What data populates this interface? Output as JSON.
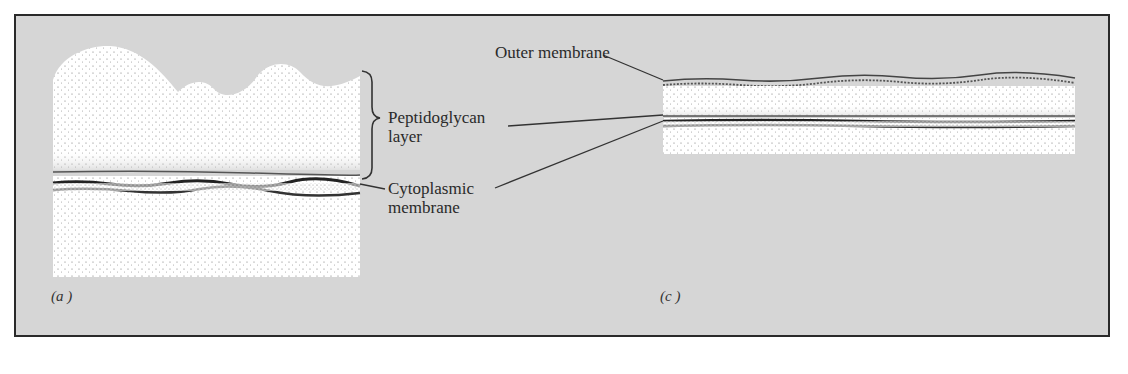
{
  "figure": {
    "panels": [
      {
        "id": "a",
        "label": "(a )"
      },
      {
        "id": "c",
        "label": "(c )"
      }
    ],
    "labels": {
      "outer_membrane": "Outer membrane",
      "peptidoglycan_line1": "Peptidoglycan",
      "peptidoglycan_line2": "layer",
      "cytoplasmic_line1": "Cytoplasmic",
      "cytoplasmic_line2": "membrane"
    },
    "colors": {
      "background": "#d6d6d6",
      "frame": "#2a2a2a",
      "cell": "#ffffff",
      "membrane": "#333333"
    }
  }
}
